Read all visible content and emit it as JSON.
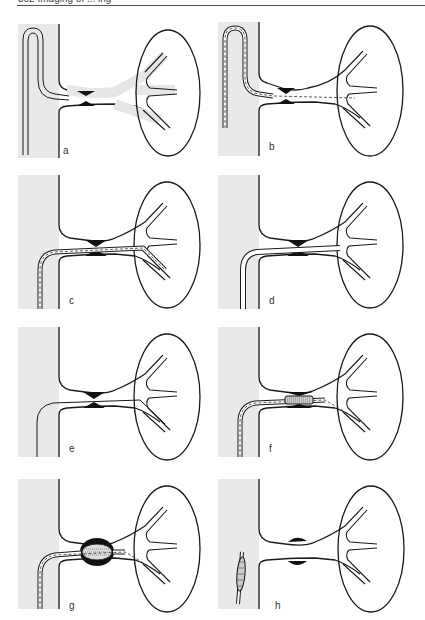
{
  "page": {
    "header_text": "302    Imaging of ... ing",
    "figure_type": "renal artery angioplasty sequence"
  },
  "panels": [
    {
      "label": "a",
      "description": "Guidewire catheter hooked into renal artery ostium; stenosis visible"
    },
    {
      "label": "b",
      "description": "Guidewire advanced through catheter past the stenosis"
    },
    {
      "label": "c",
      "description": "Guidewire passed through stenosis into distal renal artery branch"
    },
    {
      "label": "d",
      "description": "Catheter advanced over wire across stenosis"
    },
    {
      "label": "e",
      "description": "Guidewire left in place across stenosis"
    },
    {
      "label": "f",
      "description": "Balloon catheter positioned within stenosis"
    },
    {
      "label": "g",
      "description": "Balloon inflated, dilating the stenosis"
    },
    {
      "label": "h",
      "description": "Balloon withdrawn; residual widened segment"
    }
  ],
  "colors": {
    "aorta_fill": "#e9e9e9",
    "vessel_fill": "#e6e6e6",
    "stroke": "#1a1a1a",
    "stenosis": "#111111"
  }
}
